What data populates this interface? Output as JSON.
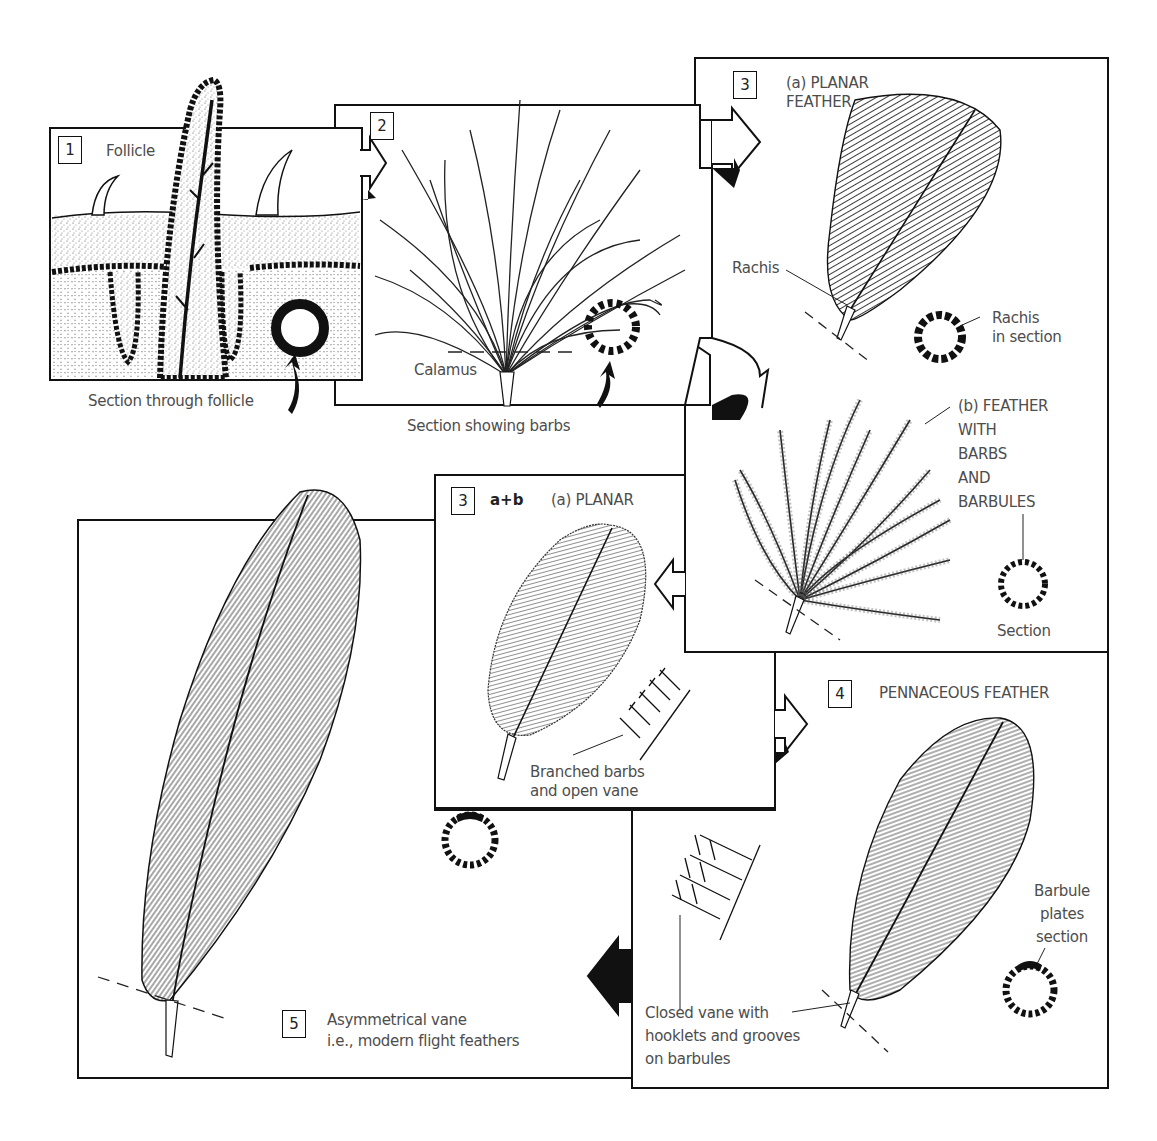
{
  "figure": {
    "stroke_color": "#111111",
    "label_color": "#4d4d4d"
  },
  "panels": [
    {
      "id": "1",
      "number": "1",
      "title": "Follicle",
      "labels": [
        "Section through follicle"
      ]
    },
    {
      "id": "2",
      "number": "2",
      "title": "",
      "labels": [
        "Calamus",
        "Section showing barbs"
      ]
    },
    {
      "id": "3",
      "number": "3",
      "title_a": "(a) PLANAR\nFEATHER",
      "labels_a": [
        "Rachis",
        "Rachis\nin section"
      ],
      "title_b": "(b) FEATHER\nWITH\nBARBS\nAND\nBARBULES",
      "labels_b": [
        "Section"
      ]
    },
    {
      "id": "3ab",
      "number": "3",
      "suffix": "a+b",
      "title": "(a) PLANAR",
      "labels": [
        "Branched barbs\nand open vane"
      ]
    },
    {
      "id": "4",
      "number": "4",
      "title": "PENNACEOUS FEATHER",
      "labels": [
        "Closed vane with\nhooklets and grooves\non barbules",
        "Barbule\nplates\nsection"
      ]
    },
    {
      "id": "5",
      "number": "5",
      "title": "Asymmetrical vane\ni.e., modern flight feathers",
      "labels": []
    }
  ],
  "flow_arrows": [
    {
      "from": "1",
      "to": "2",
      "direction": "right"
    },
    {
      "from": "2",
      "to": "3a",
      "direction": "right"
    },
    {
      "from": "2",
      "to": "3b",
      "direction": "right"
    },
    {
      "from": "3b",
      "to": "3ab",
      "direction": "left"
    },
    {
      "from": "3ab",
      "to": "4",
      "direction": "right"
    },
    {
      "from": "4",
      "to": "5",
      "direction": "left"
    }
  ]
}
